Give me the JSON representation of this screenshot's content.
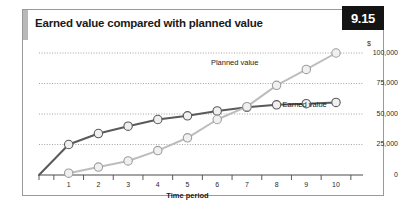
{
  "figure": {
    "number": "9.15",
    "title": "Earned value compared with planned value"
  },
  "chart_data": {
    "type": "line",
    "title": "Earned value compared with planned value",
    "xlabel": "Time period",
    "ylabel": "$",
    "unit_label": "$",
    "x": [
      1,
      2,
      3,
      4,
      5,
      6,
      7,
      8,
      9,
      10
    ],
    "categories": [
      "1",
      "2",
      "3",
      "4",
      "5",
      "6",
      "7",
      "8",
      "9",
      "10"
    ],
    "xlim": [
      0,
      10.6
    ],
    "ylim": [
      0,
      105000
    ],
    "ytick_values": [
      0,
      25000,
      50000,
      75000,
      100000
    ],
    "ytick_labels": [
      "0",
      "25,000",
      "50,000",
      "75,000",
      "100,000"
    ],
    "grid": true,
    "grid_style": "dotted",
    "legend": "inline-annotations",
    "series": [
      {
        "name": "Earned value",
        "color": "#5a5a5a",
        "marker": "circle",
        "values": [
          25000,
          34000,
          40000,
          45500,
          48500,
          52500,
          55500,
          57500,
          58500,
          59500
        ],
        "origin_value": 0
      },
      {
        "name": "Planned value",
        "color": "#bdbdbd",
        "marker": "circle",
        "values": [
          1500,
          6500,
          11500,
          20000,
          30500,
          45500,
          56000,
          73500,
          86500,
          100000
        ]
      }
    ],
    "annotations": [
      {
        "text": "Planned value",
        "x": 7.0,
        "y": 92000
      },
      {
        "text": "Earned value",
        "x": 8.2,
        "y": 57000
      }
    ]
  }
}
